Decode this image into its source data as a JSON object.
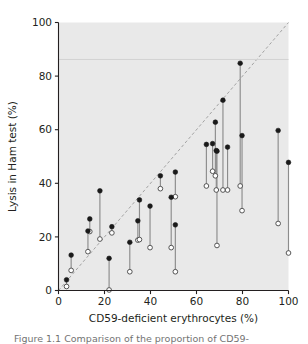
{
  "chart_data": {
    "type": "scatter",
    "title": "",
    "xlabel": "CD59-deficient erythrocytes (%)",
    "ylabel": "Lysis in Ham test (%)",
    "xlim": [
      0,
      100
    ],
    "ylim": [
      0,
      100
    ],
    "xticks": [
      0,
      20,
      40,
      60,
      80,
      100
    ],
    "yticks": [
      0,
      20,
      40,
      60,
      80,
      100
    ],
    "grid": false,
    "legend_position": "none",
    "plot_background": "#e9e9e9",
    "reference_line": {
      "type": "identity-dashed",
      "from": [
        0,
        0
      ],
      "to": [
        100,
        100
      ],
      "style": "dashed",
      "color": "#9a9a9a"
    },
    "marker_styles": {
      "filled": {
        "name": "filled-circle",
        "fill": "#1a1a1a",
        "stroke": "#1a1a1a"
      },
      "open": {
        "name": "open-circle",
        "fill": "#ffffff",
        "stroke": "#4d4d4d"
      }
    },
    "connector_color": "#8c8c8c",
    "series": [
      {
        "name": "Upper value (filled circle)",
        "marker": "filled"
      },
      {
        "name": "Lower value (open circle)",
        "marker": "open"
      }
    ],
    "pairs": [
      {
        "x": 3.5,
        "filled": 4.0,
        "open": 1.5
      },
      {
        "x": 5.5,
        "filled": 13.2,
        "open": 7.5
      },
      {
        "x": 12.8,
        "filled": 22.2,
        "open": 14.5
      },
      {
        "x": 13.6,
        "filled": 26.7,
        "open": 22.0
      },
      {
        "x": 18.0,
        "filled": 37.2,
        "open": 19.2
      },
      {
        "x": 22.0,
        "filled": 12.0,
        "open": 0.2
      },
      {
        "x": 23.2,
        "filled": 23.8,
        "open": 21.5
      },
      {
        "x": 31.0,
        "filled": 18.0,
        "open": 7.0
      },
      {
        "x": 34.5,
        "filled": 26.0,
        "open": 18.8
      },
      {
        "x": 35.2,
        "filled": 33.8,
        "open": 19.0
      },
      {
        "x": 39.8,
        "filled": 31.5,
        "open": 16.0
      },
      {
        "x": 44.3,
        "filled": 42.8,
        "open": 38.0
      },
      {
        "x": 49.0,
        "filled": 34.8,
        "open": 16.0
      },
      {
        "x": 50.8,
        "filled": 44.2,
        "open": 35.0
      },
      {
        "x": 50.8,
        "filled": 24.5,
        "open": 7.0
      },
      {
        "x": 64.3,
        "filled": 54.5,
        "open": 39.0
      },
      {
        "x": 67.0,
        "filled": 54.8,
        "open": 44.5
      },
      {
        "x": 68.2,
        "filled": 62.8,
        "open": 42.8
      },
      {
        "x": 68.6,
        "filled": 52.2,
        "open": 37.5
      },
      {
        "x": 68.9,
        "filled": 52.0,
        "open": 16.8
      },
      {
        "x": 71.5,
        "filled": 71.0,
        "open": 37.5
      },
      {
        "x": 73.5,
        "filled": 53.5,
        "open": 37.5
      },
      {
        "x": 79.0,
        "filled": 84.8,
        "open": 39.0
      },
      {
        "x": 79.8,
        "filled": 57.8,
        "open": 29.8
      },
      {
        "x": 95.5,
        "filled": 59.7,
        "open": 25.0
      },
      {
        "x": 100.0,
        "filled": 47.8,
        "open": 14.0
      }
    ]
  },
  "axes": {
    "x_tick_labels": [
      "0",
      "20",
      "40",
      "60",
      "80",
      "100"
    ],
    "y_tick_labels": [
      "0",
      "20",
      "40",
      "60",
      "80",
      "100"
    ],
    "x_axis_title": "CD59-deficient erythrocytes (%)",
    "y_axis_title": "Lysis in Ham test (%)"
  },
  "caption": {
    "text": "Figure 1.1   Comparison of the proportion of CD59-"
  }
}
